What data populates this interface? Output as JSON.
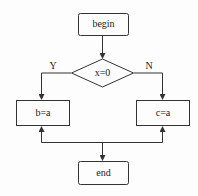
{
  "diagram": {
    "type": "flowchart",
    "nodes": {
      "begin": {
        "label": "begin",
        "shape": "rounded-rect"
      },
      "decision": {
        "label": "x=0",
        "shape": "diamond"
      },
      "left": {
        "label": "b=a",
        "shape": "rect"
      },
      "right": {
        "label": "c=a",
        "shape": "rect"
      },
      "end": {
        "label": "end",
        "shape": "rounded-rect"
      }
    },
    "edges": {
      "yes_label": "Y",
      "no_label": "N"
    },
    "colors": {
      "stroke": "#333333",
      "background": "#fdfdfd"
    }
  }
}
